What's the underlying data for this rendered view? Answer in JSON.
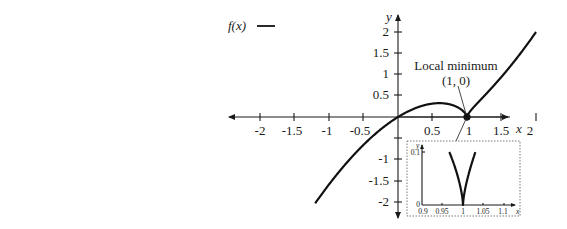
{
  "chart_data": {
    "type": "line",
    "title": "",
    "legend": {
      "label": "f(x)",
      "position": "top-left"
    },
    "xlabel": "x",
    "ylabel": "y",
    "xlim": [
      -2,
      2
    ],
    "ylim": [
      -2,
      2
    ],
    "x_ticks": [
      "-2",
      "-1.5",
      "-1",
      "-0.5",
      "0.5",
      "1",
      "1.5",
      "2"
    ],
    "y_ticks": [
      "2",
      "1.5",
      "1",
      "0.5",
      "-1",
      "-1.5",
      "-2"
    ],
    "grid": false,
    "series": [
      {
        "name": "f(x)",
        "x": [
          -1.2,
          -1.0,
          -0.8,
          -0.6,
          -0.4,
          -0.2,
          0.0,
          0.2,
          0.4,
          0.6,
          0.8,
          0.9,
          1.0,
          1.1,
          1.25,
          1.5,
          1.75,
          2.0
        ],
        "y": [
          -2.03,
          -1.59,
          -1.19,
          -0.82,
          -0.5,
          -0.23,
          0.0,
          0.17,
          0.28,
          0.33,
          0.27,
          0.19,
          0.0,
          0.24,
          0.5,
          0.94,
          1.44,
          2.0
        ]
      }
    ],
    "annotations": [
      {
        "text": "Local minimum",
        "at": [
          1,
          0
        ]
      },
      {
        "text": "(1, 0)",
        "at": [
          1,
          0
        ]
      }
    ],
    "inset": {
      "xlim": [
        0.9,
        1.1
      ],
      "ylim": [
        0,
        0.1
      ],
      "x_ticks": [
        "0.9",
        "0.95",
        "1",
        "1.05",
        "1.1"
      ],
      "y_ticks": [
        "0",
        "0.1"
      ],
      "xlabel": "x",
      "ylabel": "y",
      "description": "Zoom near x = 1 showing cusp at (1, 0)"
    }
  },
  "labels": {
    "legend_text": "f(x)",
    "x_axis": "x",
    "y_axis": "y",
    "annotation_title": "Local minimum",
    "annotation_point": "(1, 0)",
    "inset_x": "x",
    "inset_y": "y"
  }
}
